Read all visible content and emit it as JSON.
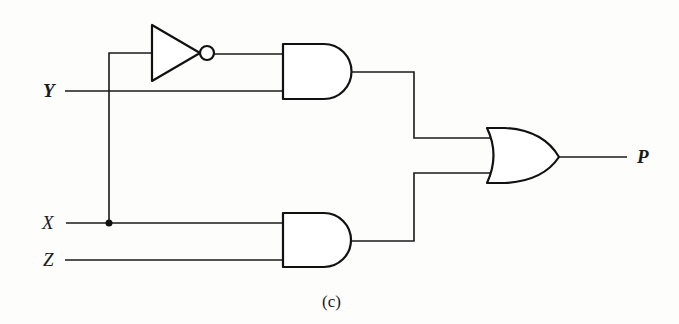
{
  "diagram": {
    "type": "logic-circuit",
    "caption": "(c)",
    "inputs": [
      {
        "id": "Y",
        "label": "Y"
      },
      {
        "id": "X",
        "label": "X"
      },
      {
        "id": "Z",
        "label": "Z"
      }
    ],
    "outputs": [
      {
        "id": "P",
        "label": "P"
      }
    ],
    "gates": [
      {
        "id": "not1",
        "type": "NOT",
        "inputs": [
          "X"
        ]
      },
      {
        "id": "and1",
        "type": "AND",
        "inputs": [
          "not1",
          "Y"
        ]
      },
      {
        "id": "and2",
        "type": "AND",
        "inputs": [
          "X",
          "Z"
        ]
      },
      {
        "id": "or1",
        "type": "OR",
        "inputs": [
          "and1",
          "and2"
        ],
        "output": "P"
      }
    ],
    "expression": "P = (NOT X AND Y) OR (X AND Z)",
    "colors": {
      "line": "#1a1a1a",
      "background": "#fdfdfc"
    }
  }
}
